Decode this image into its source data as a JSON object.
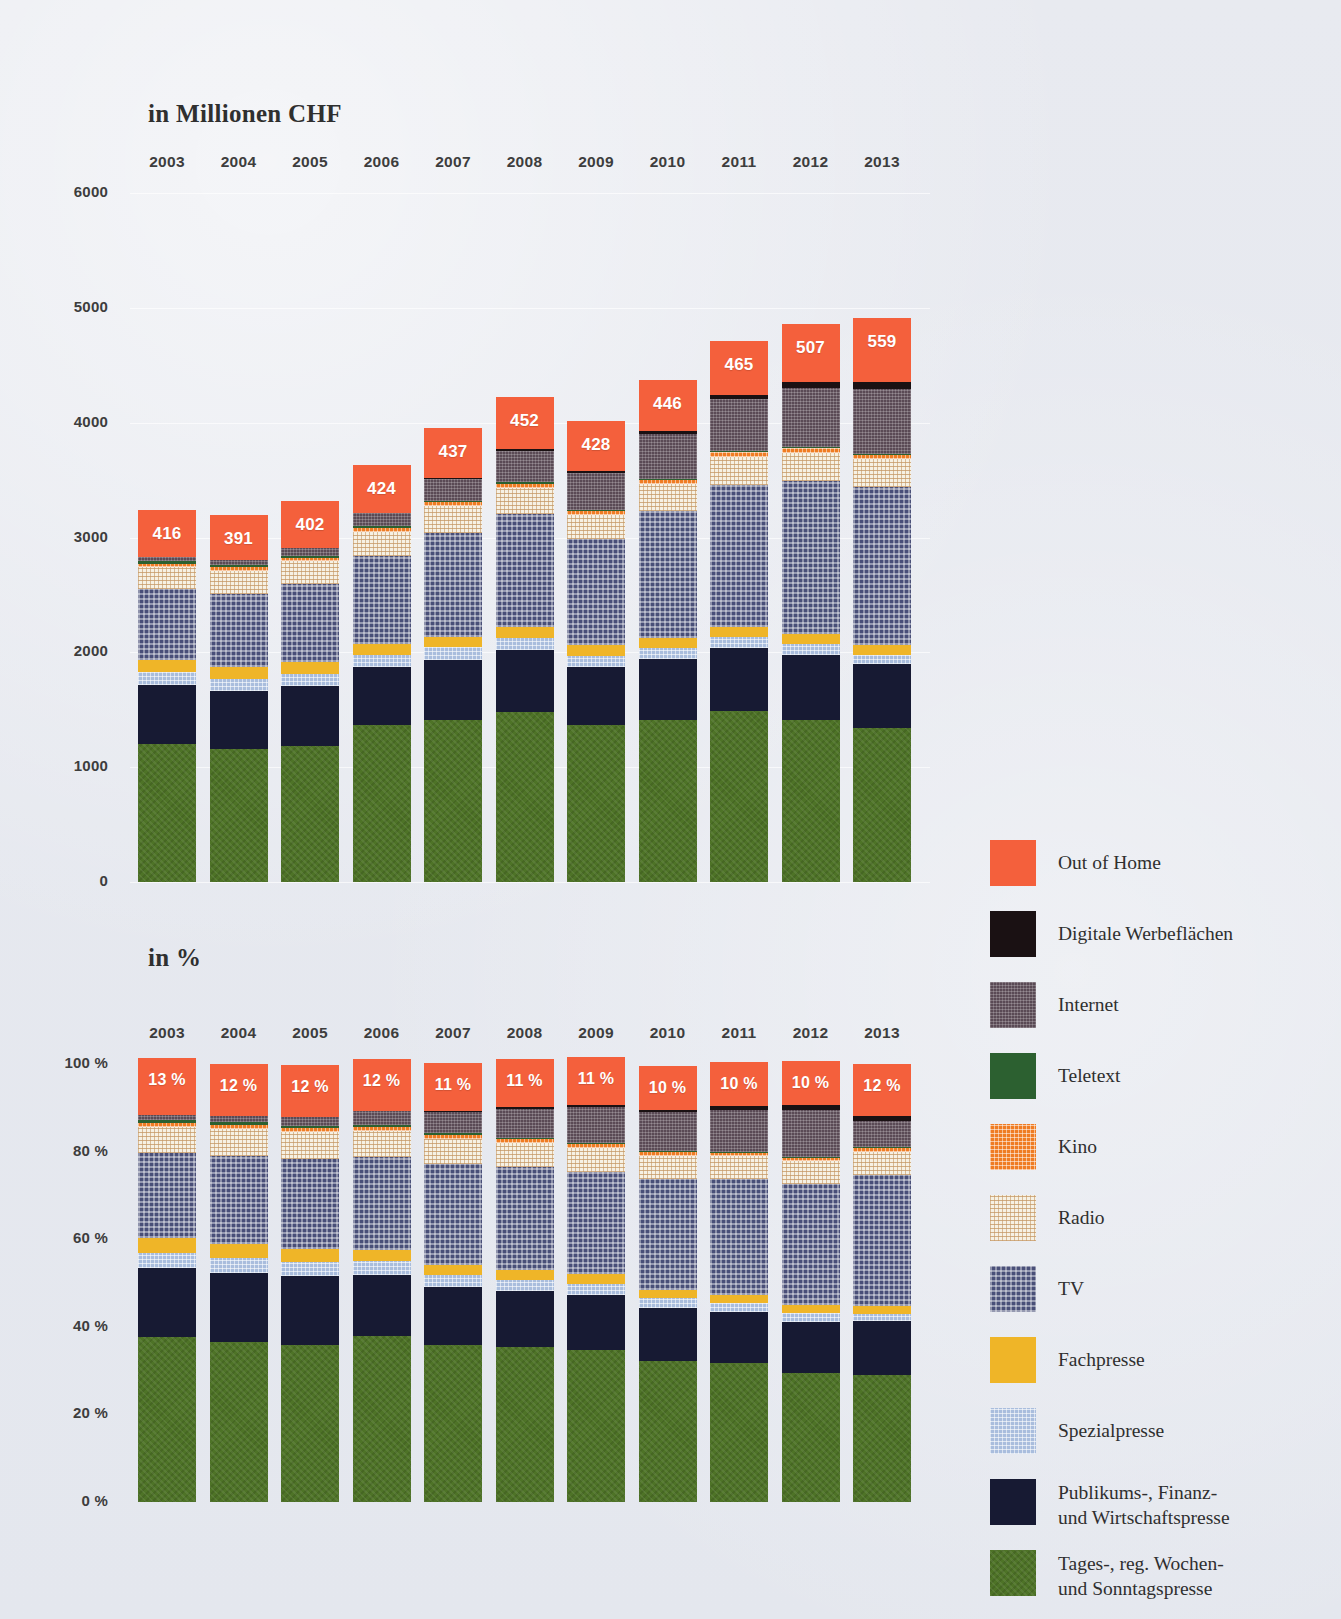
{
  "titles": {
    "chf": "in Millionen CHF",
    "pct": "in %"
  },
  "legend": [
    {
      "key": "out_of_home",
      "label": "Out of Home",
      "color": "#f4603c"
    },
    {
      "key": "digitale_werbeflaechen",
      "label": "Digitale Werbeflächen",
      "color": "#1a1113"
    },
    {
      "key": "internet",
      "label": "Internet",
      "color": "#5a4a55"
    },
    {
      "key": "teletext",
      "label": "Teletext",
      "color": "#2c6030"
    },
    {
      "key": "kino",
      "label": "Kino",
      "color": "#ef7c23"
    },
    {
      "key": "radio",
      "label": "Radio",
      "color": "#f6f1e4"
    },
    {
      "key": "tv",
      "label": "TV",
      "color": "#494f78"
    },
    {
      "key": "fachpresse",
      "label": "Fachpresse",
      "color": "#efb528"
    },
    {
      "key": "spezialpresse",
      "label": "Spezialpresse",
      "color": "#a9bddd"
    },
    {
      "key": "publikums_finanz_wirtschaftspresse",
      "label": "Publikums-, Finanz-\nund Wirtschaftspresse",
      "color": "#171a33"
    },
    {
      "key": "tages_wochen_sonntagspresse",
      "label": "Tages-, reg. Wochen-\nund Sonntagspresse",
      "color": "#4e7327"
    }
  ],
  "chart_data": [
    {
      "type": "bar",
      "stacked": true,
      "title": "in Millionen CHF",
      "xlabel": "",
      "ylabel": "",
      "ylim": [
        0,
        6000
      ],
      "yticks": [
        "0",
        "1000",
        "2000",
        "3000",
        "4000",
        "5000",
        "6000"
      ],
      "ytick_values": [
        0,
        1000,
        2000,
        3000,
        4000,
        5000,
        6000
      ],
      "grid": true,
      "legend_position": "right",
      "categories": [
        "2003",
        "2004",
        "2005",
        "2006",
        "2007",
        "2008",
        "2009",
        "2010",
        "2011",
        "2012",
        "2013"
      ],
      "data_labels": {
        "series": "Out of Home",
        "values": [
          416,
          391,
          402,
          424,
          437,
          452,
          428,
          446,
          465,
          507,
          559
        ]
      },
      "series": [
        {
          "name": "Tages-, reg. Wochen- und Sonntagspresse",
          "values": [
            1205,
            1160,
            1185,
            1370,
            1415,
            1480,
            1370,
            1410,
            1490,
            1410,
            1340
          ]
        },
        {
          "name": "Publikums-, Finanz- und Wirtschaftspresse",
          "values": [
            510,
            500,
            520,
            500,
            520,
            540,
            500,
            530,
            545,
            565,
            560
          ]
        },
        {
          "name": "Spezialpresse",
          "values": [
            110,
            112,
            110,
            110,
            108,
            105,
            100,
            100,
            100,
            98,
            80
          ]
        },
        {
          "name": "Fachpresse",
          "values": [
            105,
            100,
            100,
            95,
            95,
            95,
            90,
            85,
            85,
            85,
            80
          ]
        },
        {
          "name": "TV",
          "values": [
            620,
            640,
            680,
            760,
            905,
            985,
            925,
            1105,
            1240,
            1330,
            1380
          ]
        },
        {
          "name": "Radio",
          "values": [
            195,
            200,
            200,
            215,
            230,
            225,
            215,
            235,
            245,
            250,
            245
          ]
        },
        {
          "name": "Kino",
          "values": [
            25,
            28,
            30,
            35,
            35,
            38,
            34,
            36,
            38,
            40,
            40
          ]
        },
        {
          "name": "Teletext",
          "values": [
            22,
            20,
            18,
            16,
            14,
            12,
            10,
            9,
            8,
            7,
            6
          ]
        },
        {
          "name": "Internet",
          "values": [
            35,
            45,
            70,
            110,
            185,
            275,
            320,
            390,
            455,
            520,
            560
          ]
        },
        {
          "name": "Digitale Werbeflächen",
          "values": [
            0,
            0,
            0,
            0,
            12,
            18,
            20,
            25,
            38,
            52,
            60
          ]
        },
        {
          "name": "Out of Home",
          "values": [
            416,
            391,
            402,
            424,
            437,
            452,
            428,
            446,
            465,
            507,
            559
          ]
        }
      ]
    },
    {
      "type": "bar",
      "stacked": true,
      "normalized": true,
      "title": "in %",
      "xlabel": "",
      "ylabel": "",
      "ylim": [
        0,
        100
      ],
      "yticks": [
        "0 %",
        "20 %",
        "40 %",
        "60 %",
        "80 %",
        "100 %"
      ],
      "ytick_values": [
        0,
        20,
        40,
        60,
        80,
        100
      ],
      "grid": false,
      "legend_position": "right",
      "categories": [
        "2003",
        "2004",
        "2005",
        "2006",
        "2007",
        "2008",
        "2009",
        "2010",
        "2011",
        "2012",
        "2013"
      ],
      "data_labels": {
        "series": "Out of Home",
        "values": [
          "13 %",
          "12 %",
          "12 %",
          "12 %",
          "11 %",
          "11 %",
          "11 %",
          "10 %",
          "10 %",
          "10 %",
          "12 %"
        ]
      },
      "series": [
        {
          "name": "Tages-, reg. Wochen- und Sonntagspresse",
          "values": [
            37.6,
            36.5,
            35.8,
            38.0,
            35.9,
            35.3,
            34.6,
            32.2,
            31.8,
            29.4,
            29.1
          ]
        },
        {
          "name": "Publikums-, Finanz- und Wirtschaftspresse",
          "values": [
            15.9,
            15.7,
            15.7,
            13.9,
            13.2,
            12.9,
            12.6,
            12.1,
            11.6,
            11.8,
            12.2
          ]
        },
        {
          "name": "Spezialpresse",
          "values": [
            3.4,
            3.5,
            3.3,
            3.1,
            2.7,
            2.5,
            2.5,
            2.3,
            2.1,
            2.0,
            1.7
          ]
        },
        {
          "name": "Fachpresse",
          "values": [
            3.3,
            3.1,
            3.0,
            2.6,
            2.4,
            2.3,
            2.3,
            1.9,
            1.8,
            1.8,
            1.7
          ]
        },
        {
          "name": "TV",
          "values": [
            19.4,
            20.1,
            20.6,
            21.1,
            23.0,
            23.5,
            23.4,
            25.2,
            26.4,
            27.7,
            30.0
          ]
        },
        {
          "name": "Radio",
          "values": [
            6.1,
            6.3,
            6.0,
            6.0,
            5.8,
            5.4,
            5.4,
            5.4,
            5.2,
            5.2,
            5.3
          ]
        },
        {
          "name": "Kino",
          "values": [
            0.8,
            0.9,
            0.9,
            1.0,
            0.9,
            0.9,
            0.9,
            0.8,
            0.8,
            0.8,
            0.9
          ]
        },
        {
          "name": "Teletext",
          "values": [
            0.7,
            0.6,
            0.5,
            0.4,
            0.4,
            0.3,
            0.3,
            0.2,
            0.2,
            0.1,
            0.1
          ]
        },
        {
          "name": "Internet",
          "values": [
            1.1,
            1.4,
            2.1,
            3.1,
            4.7,
            6.6,
            8.1,
            8.9,
            9.7,
            10.8,
            5.9
          ]
        },
        {
          "name": "Digitale Werbeflächen",
          "values": [
            0.0,
            0.0,
            0.0,
            0.0,
            0.3,
            0.4,
            0.5,
            0.5,
            0.8,
            1.1,
            1.2
          ]
        },
        {
          "name": "Out of Home",
          "values": [
            13.0,
            12.0,
            12.0,
            12.0,
            11.0,
            11.0,
            11.0,
            10.0,
            10.0,
            10.0,
            12.0
          ]
        }
      ]
    }
  ]
}
